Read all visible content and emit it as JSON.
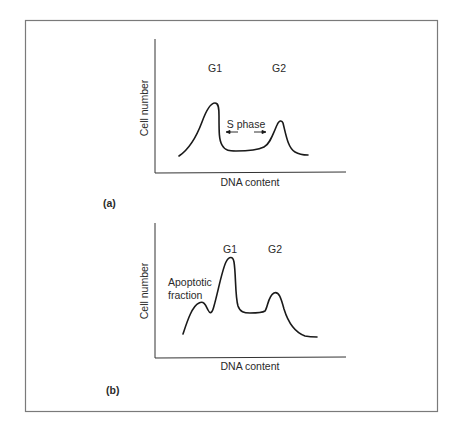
{
  "figure": {
    "frame_color": "#7a7a7a",
    "line_color": "#1a1a1a",
    "panels": [
      {
        "id": "a",
        "panel_label": "(a)",
        "y_axis_label": "Cell number",
        "x_axis_label": "DNA content",
        "peak_labels": [
          {
            "text": "G1"
          },
          {
            "text": "G2"
          }
        ],
        "annotation": "S phase"
      },
      {
        "id": "b",
        "panel_label": "(b)",
        "y_axis_label": "Cell number",
        "x_axis_label": "DNA content",
        "peak_labels": [
          {
            "text": "G1"
          },
          {
            "text": "G2"
          }
        ],
        "annotation_line1": "Apoptotic",
        "annotation_line2": "fraction"
      }
    ]
  }
}
